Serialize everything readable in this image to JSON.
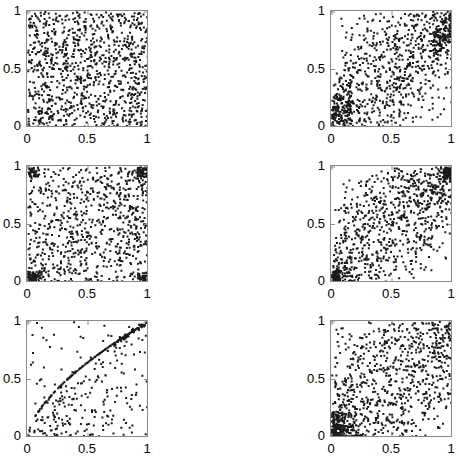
{
  "figure": {
    "width": 447,
    "height": 469,
    "background": "#ffffff",
    "axis_color": "#8a8a8a",
    "marker_color": "#1a1a1a",
    "rows": 3,
    "cols": 2
  },
  "chart_data": [
    {
      "id": "panel-r1c1",
      "type": "scatter",
      "title": "",
      "xlabel": "",
      "ylabel": "",
      "xlim": [
        0,
        1
      ],
      "ylim": [
        0,
        1
      ],
      "xticks": [
        0,
        0.5,
        1
      ],
      "yticks": [
        0,
        0.5,
        1
      ],
      "xticklabels": [
        "0",
        "0.5",
        "1"
      ],
      "yticklabels": [
        "0",
        "0.5",
        "1"
      ],
      "grid": false,
      "legend": null,
      "n_points": 1000,
      "pattern": "independent",
      "description": "Independence copula - uniform scatter over unit square",
      "marker": "square",
      "marker_size": 2,
      "seed": 11
    },
    {
      "id": "panel-r1c2",
      "type": "scatter",
      "title": "",
      "xlabel": "",
      "ylabel": "",
      "xlim": [
        0,
        1
      ],
      "ylim": [
        0,
        1
      ],
      "xticks": [
        0,
        0.5,
        1
      ],
      "yticks": [
        0,
        0.5,
        1
      ],
      "xticklabels": [
        "0",
        "0.5",
        "1"
      ],
      "yticklabels": [
        "0",
        "0.5",
        "1"
      ],
      "grid": false,
      "legend": null,
      "n_points": 1000,
      "pattern": "gaussian-positive",
      "correlation": 0.55,
      "description": "Positive dependence, denser in lower-left and upper-right corners",
      "marker": "square",
      "marker_size": 2,
      "seed": 23
    },
    {
      "id": "panel-r2c1",
      "type": "scatter",
      "title": "",
      "xlabel": "",
      "ylabel": "",
      "xlim": [
        0,
        1
      ],
      "ylim": [
        0,
        1
      ],
      "xticks": [
        0,
        0.5,
        1
      ],
      "yticks": [
        0,
        0.5,
        1
      ],
      "xticklabels": [
        "0",
        "0.5",
        "1"
      ],
      "yticklabels": [
        "0",
        "0.5",
        "1"
      ],
      "grid": false,
      "legend": null,
      "n_points": 1000,
      "pattern": "four-corner-tail",
      "correlation": 0.25,
      "description": "Weak positive dependence with heavy clustering in all four corners",
      "marker": "square",
      "marker_size": 2,
      "seed": 37
    },
    {
      "id": "panel-r2c2",
      "type": "scatter",
      "title": "",
      "xlabel": "",
      "ylabel": "",
      "xlim": [
        0,
        1
      ],
      "ylim": [
        0,
        1
      ],
      "xticks": [
        0,
        0.5,
        1
      ],
      "yticks": [
        0,
        0.5,
        1
      ],
      "xticklabels": [
        "0",
        "0.5",
        "1"
      ],
      "yticklabels": [
        "0",
        "0.5",
        "1"
      ],
      "grid": false,
      "legend": null,
      "n_points": 1000,
      "pattern": "t-copula-both-tails",
      "correlation": 0.65,
      "description": "Strong positive dependence with lower and upper tail dependence",
      "marker": "square",
      "marker_size": 2,
      "seed": 53
    },
    {
      "id": "panel-r3c1",
      "type": "scatter",
      "title": "",
      "xlabel": "",
      "ylabel": "",
      "xlim": [
        0,
        1
      ],
      "ylim": [
        0,
        1
      ],
      "xticks": [
        0,
        0.5,
        1
      ],
      "yticks": [
        0,
        0.5,
        1
      ],
      "xticklabels": [
        "0",
        "0.5",
        "1"
      ],
      "yticklabels": [
        "0",
        "0.5",
        "1"
      ],
      "grid": false,
      "legend": null,
      "n_points": 420,
      "pattern": "marshall-olkin-singular",
      "singular_curve": "concave arc from (0,0) to (1,1), v = u^0.62",
      "description": "Singular component: heavy mass on a concave curve from origin to (1,1) plus diffuse background scatter",
      "marker": "square",
      "marker_size": 2,
      "seed": 71
    },
    {
      "id": "panel-r3c2",
      "type": "scatter",
      "title": "",
      "xlabel": "",
      "ylabel": "",
      "xlim": [
        0,
        1
      ],
      "ylim": [
        0,
        1
      ],
      "xticks": [
        0,
        0.5,
        1
      ],
      "yticks": [
        0,
        0.5,
        1
      ],
      "xticklabels": [
        "0",
        "0.5",
        "1"
      ],
      "yticklabels": [
        "0",
        "0.5",
        "1"
      ],
      "grid": false,
      "legend": null,
      "n_points": 1000,
      "pattern": "clayton-lower-tail",
      "correlation": 0.4,
      "description": "Lower tail dependence: strong clustering near the origin, diffuse elsewhere",
      "marker": "square",
      "marker_size": 2,
      "seed": 97
    }
  ],
  "panels": [
    {
      "id": "panel-r1c1",
      "name": "panel-top-left",
      "left": 26,
      "top": 10,
      "width": 122,
      "height": 117
    },
    {
      "id": "panel-r1c2",
      "name": "panel-top-right",
      "left": 330,
      "top": 10,
      "width": 122,
      "height": 117
    },
    {
      "id": "panel-r2c1",
      "name": "panel-middle-left",
      "left": 26,
      "top": 165,
      "width": 122,
      "height": 117
    },
    {
      "id": "panel-r2c2",
      "name": "panel-middle-right",
      "left": 330,
      "top": 165,
      "width": 122,
      "height": 117
    },
    {
      "id": "panel-r3c1",
      "name": "panel-bottom-left",
      "left": 26,
      "top": 320,
      "width": 122,
      "height": 117
    },
    {
      "id": "panel-r3c2",
      "name": "panel-bottom-right",
      "left": 330,
      "top": 320,
      "width": 122,
      "height": 117
    }
  ]
}
